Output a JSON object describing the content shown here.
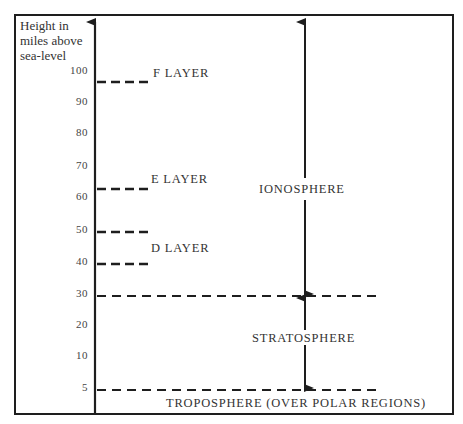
{
  "diagram": {
    "axis_title": [
      "Height in",
      "miles above",
      "sea-level"
    ],
    "ticks": [
      {
        "label": "100",
        "y": 72
      },
      {
        "label": "90",
        "y": 103
      },
      {
        "label": "80",
        "y": 134
      },
      {
        "label": "70",
        "y": 167
      },
      {
        "label": "60",
        "y": 198
      },
      {
        "label": "50",
        "y": 231
      },
      {
        "label": "40",
        "y": 263
      },
      {
        "label": "30",
        "y": 295
      },
      {
        "label": "20",
        "y": 326
      },
      {
        "label": "10",
        "y": 357
      },
      {
        "label": "5",
        "y": 389
      }
    ],
    "layers": {
      "f_layer": "F LAYER",
      "e_layer": "E LAYER",
      "d_layer": "D LAYER"
    },
    "regions": {
      "ionosphere": "IONOSPHERE",
      "stratosphere": "STRATOSPHERE",
      "troposphere": "TROPOSPHERE (OVER POLAR REGIONS)"
    },
    "colors": {
      "ink": "#1e1e1e",
      "background": "#ffffff"
    }
  }
}
